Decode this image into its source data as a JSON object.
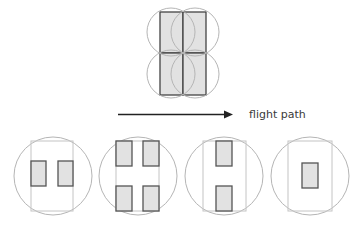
{
  "diagram": {
    "label": "flight path",
    "colors": {
      "circle_stroke": "#b5b5b5",
      "frame_stroke": "#c4c4c4",
      "fill": "#e2e2e2",
      "rect_stroke": "#555555",
      "arrow": "#222222",
      "text": "#3a3a3a"
    },
    "top_figure": {
      "description": "2x2 grid of filled rectangles with overlapping circular footprints",
      "cells": 4
    },
    "arrow": {
      "direction": "right"
    },
    "bottom_figures": [
      {
        "name": "pattern-two-side-by-side",
        "inner_rects": 2
      },
      {
        "name": "pattern-four-corners",
        "inner_rects": 4
      },
      {
        "name": "pattern-two-stacked",
        "inner_rects": 2
      },
      {
        "name": "pattern-single-center",
        "inner_rects": 1
      }
    ]
  }
}
